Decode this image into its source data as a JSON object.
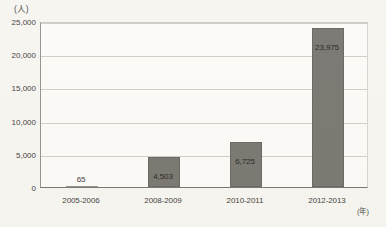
{
  "chart_data": {
    "type": "bar",
    "title": "",
    "subtitle": "",
    "xlabel": "(年)",
    "ylabel": "(人)",
    "categories": [
      "2005-2006",
      "2008-2009",
      "2010-2011",
      "2012-2013"
    ],
    "values": [
      65,
      4503,
      6725,
      23975
    ],
    "value_labels": [
      "65",
      "4,503",
      "6,725",
      "23,975"
    ],
    "ylim": [
      0,
      25000
    ],
    "ytick_values": [
      0,
      5000,
      10000,
      15000,
      20000,
      25000
    ],
    "ytick_labels": [
      "0",
      "5,000",
      "10,000",
      "15,000",
      "20,000",
      "25,000"
    ],
    "grid": true,
    "legend": false,
    "legend_position": "none",
    "series": [
      {
        "name": "",
        "values": [
          65,
          4503,
          6725,
          23975
        ]
      }
    ],
    "colors": {
      "bar_fill": "#6f6c66",
      "bar_stroke": "#5d5a55",
      "gridline": "#cdcac4",
      "axis": "#6e6b66",
      "plot_background": "#fbfaf7",
      "page_background": "#f6f4ef",
      "text": "#2f2e2c"
    }
  }
}
